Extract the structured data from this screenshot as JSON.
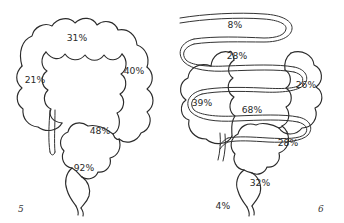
{
  "page": {
    "background_color": "#ffffff",
    "ink_color": "#2b2b2b"
  },
  "figures": [
    {
      "number": "5",
      "caption_label": "5",
      "description": "Hand-drawn haustrated colon outline with rectum and terminal ileum",
      "labels": [
        {
          "name": "transverse-colon",
          "value": "31%"
        },
        {
          "name": "ascending-colon",
          "value": "21%"
        },
        {
          "name": "descending-colon",
          "value": "40%"
        },
        {
          "name": "sigmoid-colon",
          "value": "48%"
        },
        {
          "name": "rectum",
          "value": "92%"
        }
      ]
    },
    {
      "number": "6",
      "caption_label": "6",
      "description": "Hand-drawn colon with serpentine small bowel loops overlying it",
      "labels": [
        {
          "name": "proximal-small-bowel",
          "value": "8%"
        },
        {
          "name": "mid-small-bowel",
          "value": "28%"
        },
        {
          "name": "ascending-colon",
          "value": "39%"
        },
        {
          "name": "descending-colon",
          "value": "26%"
        },
        {
          "name": "terminal-ileum",
          "value": "68%"
        },
        {
          "name": "sigmoid-colon",
          "value": "28%"
        },
        {
          "name": "rectum",
          "value": "32%"
        },
        {
          "name": "anus",
          "value": "4%"
        }
      ]
    }
  ]
}
